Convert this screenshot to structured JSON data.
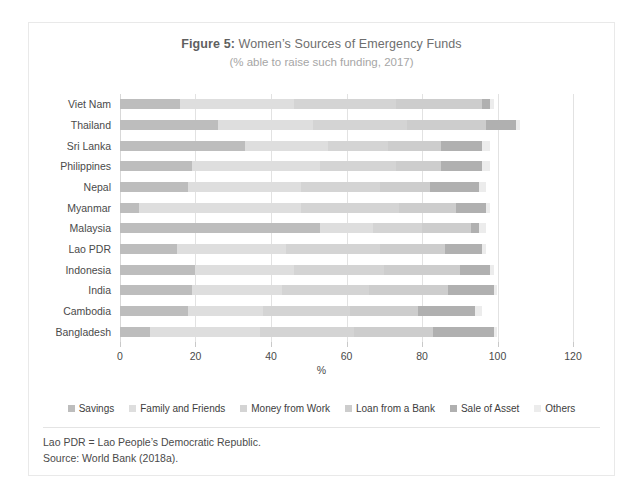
{
  "figure": {
    "title_prefix": "Figure 5:",
    "title_rest": " Women’s Sources of Emergency Funds",
    "subtitle": "(% able to raise such funding, 2017)",
    "x_axis_title": "%"
  },
  "footnotes": [
    "Lao PDR = Lao People’s Democratic Republic.",
    "Source: World Bank (2018a)."
  ],
  "colors": {
    "savings": "#bdbdbd",
    "family_and_friends": "#dedede",
    "money_from_work": "#d4d4d4",
    "loan_from_a_bank": "#cdcdcd",
    "sale_of_asset": "#b0b0b0",
    "others": "#ececec",
    "gridline": "#e2e2e2",
    "frame": "#e9e9e9",
    "title_text": "#6e6e6e",
    "subtitle_text": "#a6a6a6",
    "label_text": "#4a4a4a"
  },
  "chart_data": {
    "type": "bar",
    "orientation": "horizontal",
    "stacked": true,
    "title": "Figure 5: Women’s Sources of Emergency Funds",
    "subtitle": "(% able to raise such funding, 2017)",
    "xlabel": "%",
    "ylabel": "",
    "xlim": [
      0,
      120
    ],
    "xticks": [
      0,
      20,
      40,
      60,
      80,
      100,
      120
    ],
    "xticklabels": [
      "0",
      "20",
      "40",
      "60",
      "80",
      "100",
      "120"
    ],
    "grid": true,
    "grid_axis": "x",
    "legend_position": "bottom",
    "categories": [
      "Viet Nam",
      "Thailand",
      "Sri Lanka",
      "Philippines",
      "Nepal",
      "Myanmar",
      "Malaysia",
      "Lao PDR",
      "Indonesia",
      "India",
      "Cambodia",
      "Bangladesh"
    ],
    "series": [
      {
        "name": "Savings",
        "color": "#bdbdbd",
        "values": [
          16,
          26,
          33,
          19,
          18,
          5,
          53,
          15,
          20,
          19,
          18,
          8
        ]
      },
      {
        "name": "Family and Friends",
        "color": "#dedede",
        "values": [
          30,
          25,
          22,
          34,
          30,
          43,
          14,
          29,
          26,
          24,
          20,
          29
        ]
      },
      {
        "name": "Money from Work",
        "color": "#d4d4d4",
        "values": [
          27,
          25,
          16,
          20,
          21,
          26,
          13,
          25,
          24,
          23,
          23,
          25
        ]
      },
      {
        "name": "Loan from a Bank",
        "color": "#cdcdcd",
        "values": [
          23,
          21,
          14,
          12,
          13,
          15,
          13,
          17,
          20,
          21,
          18,
          21
        ]
      },
      {
        "name": "Sale of Asset",
        "color": "#b0b0b0",
        "values": [
          2,
          8,
          11,
          11,
          13,
          8,
          2,
          10,
          8,
          12,
          15,
          16
        ]
      },
      {
        "name": "Others",
        "color": "#ececec",
        "values": [
          1,
          1,
          2,
          2,
          2,
          1,
          2,
          1,
          1,
          1,
          2,
          1
        ]
      }
    ],
    "totals": [
      99,
      106,
      98,
      98,
      97,
      98,
      97,
      97,
      99,
      100,
      96,
      100
    ]
  }
}
